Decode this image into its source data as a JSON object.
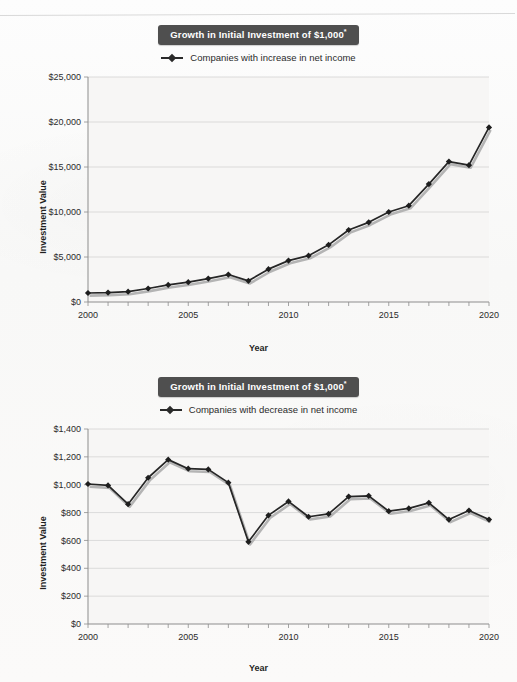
{
  "page": {
    "background_color": "#fbfbfb",
    "banner_color": "#4f4f4f",
    "series_color": "#262626"
  },
  "figures": [
    {
      "id": "figure-increase",
      "title": "Growth in Initial Investment of $1,000",
      "title_superscript": "*",
      "legend_label": "Companies with increase in net income",
      "chart_data": {
        "type": "line",
        "title": "Growth in Initial Investment of $1,000*",
        "xlabel": "Year",
        "ylabel": "Investment Value",
        "grid": true,
        "legend_position": "top-center",
        "xlim": [
          2000,
          2020
        ],
        "ylim": [
          0,
          25000
        ],
        "ytick_labels": [
          "$0",
          "$5,000",
          "$10,000",
          "$15,000",
          "$20,000",
          "$25,000"
        ],
        "ytick_values": [
          0,
          5000,
          10000,
          15000,
          20000,
          25000
        ],
        "xtick_labels": [
          "2000",
          "2005",
          "2010",
          "2015",
          "2020"
        ],
        "xtick_values": [
          2000,
          2005,
          2010,
          2015,
          2020
        ],
        "minor_xticks_every": 1,
        "series": [
          {
            "name": "Companies with increase in net income",
            "x": [
              2000,
              2001,
              2002,
              2003,
              2004,
              2005,
              2006,
              2007,
              2008,
              2009,
              2010,
              2011,
              2012,
              2013,
              2014,
              2015,
              2016,
              2017,
              2018,
              2019,
              2020
            ],
            "values": [
              1000,
              1050,
              1150,
              1500,
              1900,
              2200,
              2600,
              3050,
              2350,
              3650,
              4600,
              5150,
              6350,
              8000,
              8850,
              10000,
              10700,
              13100,
              15600,
              15200,
              19400,
              22400
            ]
          }
        ]
      }
    },
    {
      "id": "figure-decrease",
      "title": "Growth in Initial Investment of $1,000",
      "title_superscript": "*",
      "legend_label": "Companies with decrease in net income",
      "chart_data": {
        "type": "line",
        "title": "Growth in Initial Investment of $1,000*",
        "xlabel": "Year",
        "ylabel": "Investment Value",
        "grid": true,
        "legend_position": "top-center",
        "xlim": [
          2000,
          2020
        ],
        "ylim": [
          0,
          1400
        ],
        "ytick_labels": [
          "$0",
          "$200",
          "$400",
          "$600",
          "$800",
          "$1,000",
          "$1,200",
          "$1,400"
        ],
        "ytick_values": [
          0,
          200,
          400,
          600,
          800,
          1000,
          1200,
          1400
        ],
        "xtick_labels": [
          "2000",
          "2005",
          "2010",
          "2015",
          "2020"
        ],
        "xtick_values": [
          2000,
          2005,
          2010,
          2015,
          2020
        ],
        "minor_xticks_every": 1,
        "series": [
          {
            "name": "Companies with decrease in net income",
            "x": [
              2000,
              2001,
              2002,
              2003,
              2004,
              2005,
              2006,
              2007,
              2008,
              2009,
              2010,
              2011,
              2012,
              2013,
              2014,
              2015,
              2016,
              2017,
              2018,
              2019,
              2020
            ],
            "values": [
              1005,
              995,
              860,
              1050,
              1180,
              1115,
              1110,
              1015,
              590,
              780,
              880,
              770,
              790,
              915,
              920,
              810,
              830,
              870,
              750,
              815,
              750
            ]
          }
        ]
      }
    }
  ]
}
